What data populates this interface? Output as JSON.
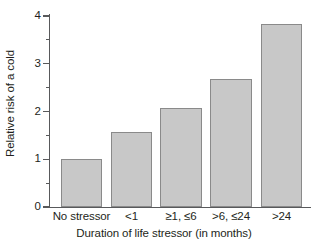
{
  "chart_data": {
    "type": "bar",
    "title": "",
    "xlabel": "Duration of life stressor (in months)",
    "ylabel": "Relative risk of a cold",
    "categories": [
      "No stressor",
      "<1",
      "≥1, ≤6",
      ">6, ≤24",
      ">24"
    ],
    "values": [
      1.0,
      1.58,
      2.08,
      2.68,
      3.83
    ],
    "ylim": [
      0,
      4
    ],
    "yticks": [
      0,
      1,
      2,
      3,
      4
    ],
    "ytick_labels": [
      "0",
      "1",
      "2",
      "3",
      "4"
    ],
    "yminor_ticks": [
      0.5,
      1.5,
      2.5,
      3.5
    ],
    "grid": false,
    "legend": false,
    "bar_fill_color": "#c8c8c8",
    "bar_edge_color": "#8a8a8a",
    "axis_color": "#58595b"
  }
}
